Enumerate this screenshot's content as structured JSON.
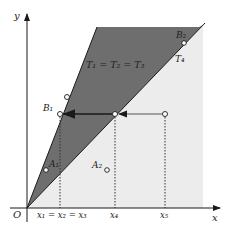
{
  "colors": {
    "dark_region": "#6e6e6e",
    "light_region": "#ececec",
    "line": "#1a1a1a",
    "arrow": "#1a1a1a",
    "gray_arrow": "#888888"
  },
  "axes": {
    "x_label": "x",
    "y_label": "y",
    "origin_label": "O"
  },
  "x_ticks": [
    {
      "label": "x₁ = x₂ = x₃"
    },
    {
      "label": "x₄"
    },
    {
      "label": "x₅"
    }
  ],
  "regions": {
    "dark_label": "T₁ = T₂ = T₃",
    "light_label": "T₄"
  },
  "points": {
    "A1": "A₁",
    "A2": "A₂",
    "B1": "B₁",
    "B2": "B₂"
  }
}
